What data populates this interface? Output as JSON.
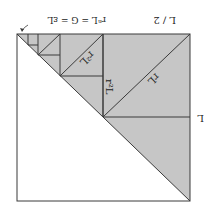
{
  "diagram": {
    "orientation": "rotated-180",
    "colors": {
      "shade": "#c6c6c6",
      "stroke": "#3a3a3a",
      "background": "#ffffff"
    },
    "labels": {
      "side": "L",
      "half": "L / 2",
      "r": "rL",
      "r2": "r²L",
      "r2b": "r²L",
      "limit": "rⁿL = G = εL"
    }
  }
}
